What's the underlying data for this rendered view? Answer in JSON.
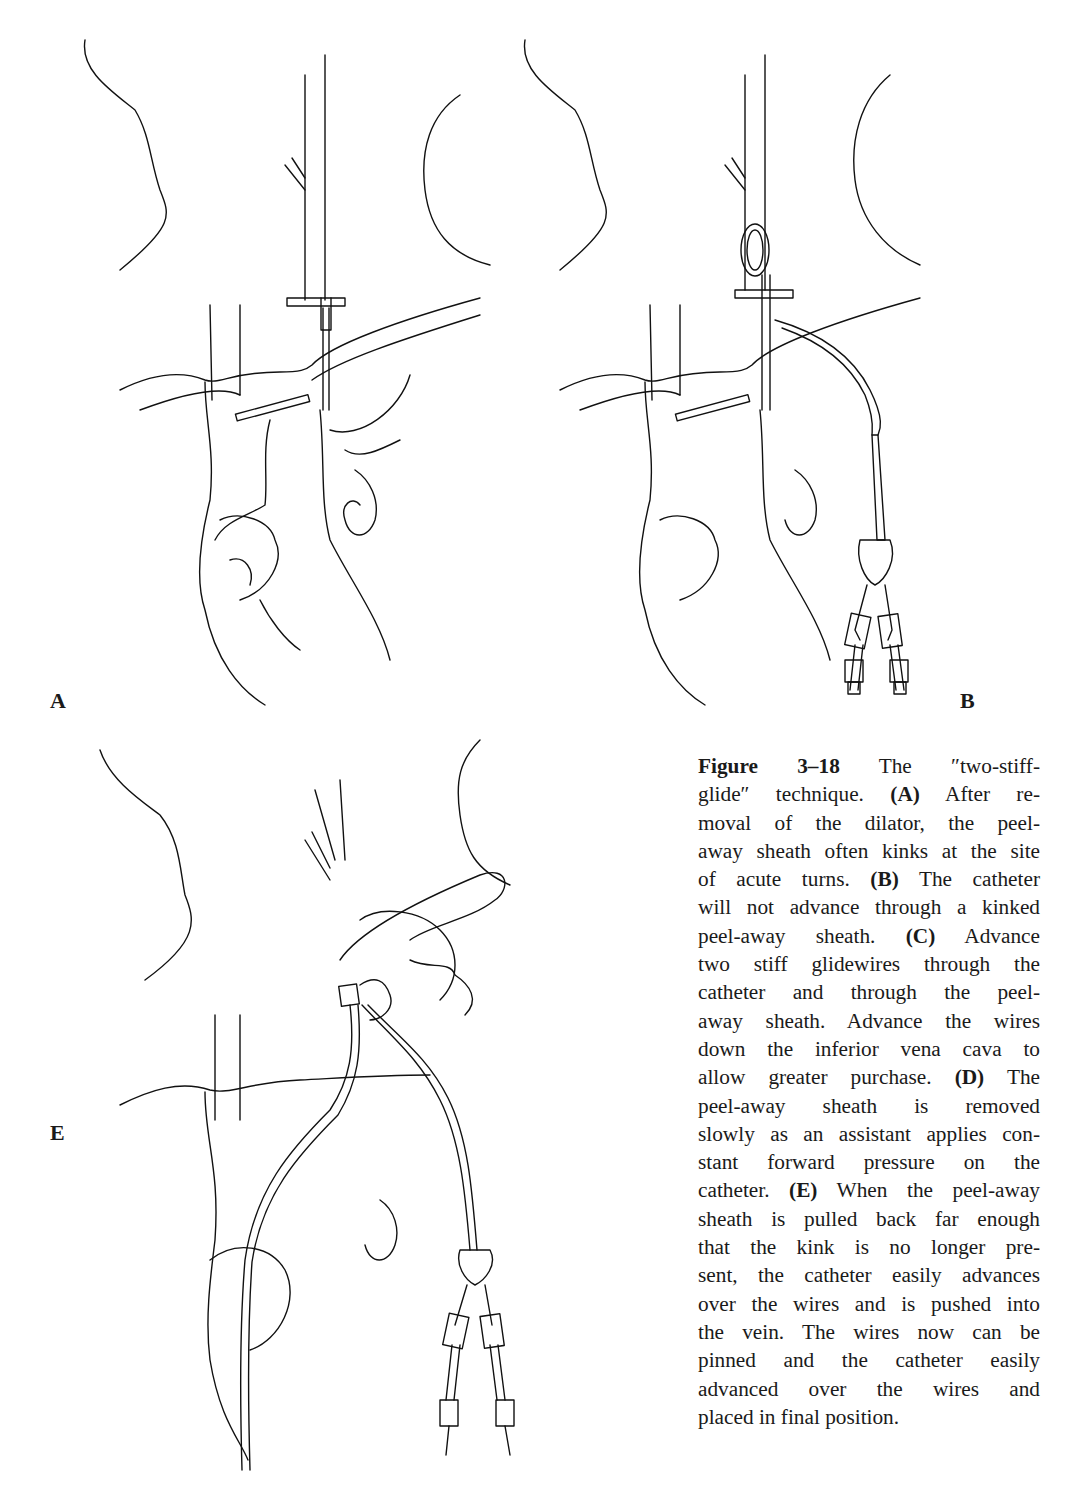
{
  "figure": {
    "number": "Figure 3–18",
    "panels": [
      {
        "id": "A",
        "label": "A"
      },
      {
        "id": "B",
        "label": "B"
      },
      {
        "id": "E",
        "label": "E"
      }
    ],
    "caption_lines": [
      [
        {
          "b": "Figure 3–18"
        },
        {
          "t": " The ''two-stiff-"
        }
      ],
      [
        {
          "t": "glide'' technique. "
        },
        {
          "b": "(A)"
        },
        {
          "t": " After re-"
        }
      ],
      [
        {
          "t": "moval of the dilator, the peel-"
        }
      ],
      [
        {
          "t": "away sheath often kinks at the site"
        }
      ],
      [
        {
          "t": "of acute turns. "
        },
        {
          "b": "(B)"
        },
        {
          "t": " The catheter"
        }
      ],
      [
        {
          "t": "will not advance through a kinked"
        }
      ],
      [
        {
          "t": "peel-away sheath. "
        },
        {
          "b": "(C)"
        },
        {
          "t": " Advance"
        }
      ],
      [
        {
          "t": "two stiff glidewires through the"
        }
      ],
      [
        {
          "t": "catheter and through the peel-"
        }
      ],
      [
        {
          "t": "away sheath. Advance the wires"
        }
      ],
      [
        {
          "t": "down the inferior vena cava to"
        }
      ],
      [
        {
          "t": "allow greater purchase. "
        },
        {
          "b": "(D)"
        },
        {
          "t": " The"
        }
      ],
      [
        {
          "t": "peel-away sheath is removed"
        }
      ],
      [
        {
          "t": "slowly as an assistant applies con-"
        }
      ],
      [
        {
          "t": "stant forward pressure on the"
        }
      ],
      [
        {
          "t": "catheter. "
        },
        {
          "b": "(E)"
        },
        {
          "t": " When the peel-away"
        }
      ],
      [
        {
          "t": "sheath is pulled back far enough"
        }
      ],
      [
        {
          "t": "that the kink is no longer pre-"
        }
      ],
      [
        {
          "t": "sent, the catheter easily advances"
        }
      ],
      [
        {
          "t": "over the wires and is pushed into"
        }
      ],
      [
        {
          "t": "the vein. The wires now can be"
        }
      ],
      [
        {
          "t": "pinned and the catheter easily"
        }
      ],
      [
        {
          "t": "advanced over the wires and"
        }
      ],
      [
        {
          "t": "placed in final position."
        }
      ]
    ]
  }
}
